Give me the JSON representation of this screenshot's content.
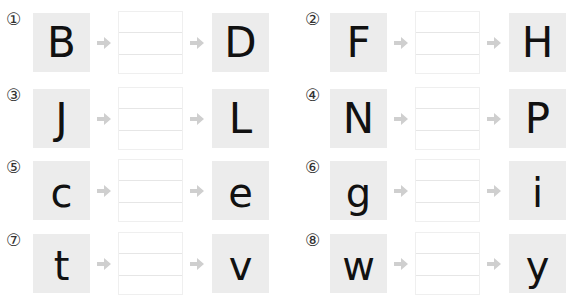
{
  "exercises": [
    {
      "number": "①",
      "from": "B",
      "to": "D",
      "answer": ""
    },
    {
      "number": "②",
      "from": "F",
      "to": "H",
      "answer": ""
    },
    {
      "number": "③",
      "from": "J",
      "to": "L",
      "answer": ""
    },
    {
      "number": "④",
      "from": "N",
      "to": "P",
      "answer": ""
    },
    {
      "number": "⑤",
      "from": "c",
      "to": "e",
      "answer": ""
    },
    {
      "number": "⑥",
      "from": "g",
      "to": "i",
      "answer": ""
    },
    {
      "number": "⑦",
      "from": "t",
      "to": "v",
      "answer": ""
    },
    {
      "number": "⑧",
      "from": "w",
      "to": "y",
      "answer": ""
    }
  ],
  "colors": {
    "tile_background": "#ececec",
    "arrow": "#cfcfcf",
    "letter": "#111111"
  }
}
